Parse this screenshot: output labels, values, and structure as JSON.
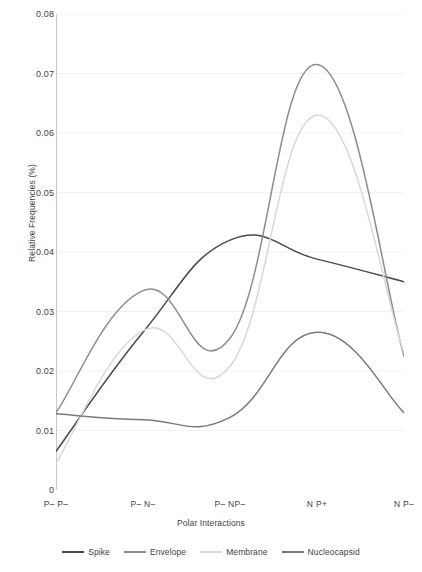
{
  "chart_data": {
    "type": "line",
    "title": "",
    "xlabel": "Polar Interactions",
    "ylabel": "Relative Frequencies (%)",
    "categories": [
      "P– P–",
      "P– N–",
      "P– NP–",
      "N P+",
      "N P–"
    ],
    "ylim": [
      0,
      0.08
    ],
    "yticks": [
      "0",
      "0.01",
      "0.02",
      "0.03",
      "0.04",
      "0.05",
      "0.06",
      "0.07",
      "0.08"
    ],
    "ytick_values": [
      0,
      0.01,
      0.02,
      0.03,
      0.04,
      0.05,
      0.06,
      0.07,
      0.08
    ],
    "grid": "horizontal-faint",
    "legend_position": "bottom",
    "smoothing": "spline",
    "series": [
      {
        "name": "Spike",
        "color": "#4a4a4a",
        "values": [
          0.0065,
          0.0265,
          0.042,
          0.0388,
          0.035
        ]
      },
      {
        "name": "Envelope",
        "color": "#8c8c8c",
        "values": [
          0.013,
          0.0335,
          0.0255,
          0.0715,
          0.0225
        ]
      },
      {
        "name": "Membrane",
        "color": "#d8d8d8",
        "values": [
          0.0045,
          0.0268,
          0.0208,
          0.063,
          0.023
        ]
      },
      {
        "name": "Nucleocapsid",
        "color": "#7a7a7a",
        "values": [
          0.0128,
          0.0118,
          0.0122,
          0.0265,
          0.013
        ]
      }
    ]
  }
}
